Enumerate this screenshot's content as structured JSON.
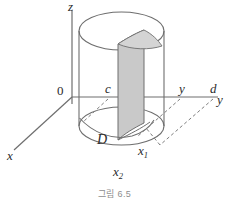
{
  "figure": {
    "caption": "그림 6.5",
    "axes": [
      {
        "id": "z",
        "label": "z"
      },
      {
        "id": "y",
        "label": "y"
      },
      {
        "id": "x",
        "label": "x"
      }
    ],
    "origin_label": "0",
    "tick_labels": [
      {
        "id": "c",
        "label": "c"
      },
      {
        "id": "y-tick",
        "label": "y"
      },
      {
        "id": "d",
        "label": "d"
      }
    ],
    "region_label": "D",
    "point_labels": [
      {
        "id": "x1",
        "base": "x",
        "sub": "1"
      },
      {
        "id": "x2",
        "base": "x",
        "sub": "2"
      }
    ],
    "colors": {
      "stroke": "#6e6e6e",
      "stroke_dark": "#5a5a5a",
      "shade_fill": "#c9c9c9",
      "shade_fill_light": "#d4d4d4",
      "text": "#2b2b2b",
      "caption": "#8e8e8e",
      "background": "#ffffff"
    }
  }
}
